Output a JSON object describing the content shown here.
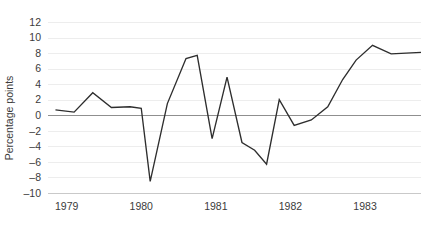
{
  "chart_data": {
    "type": "line",
    "title": "",
    "xlabel": "",
    "ylabel": "Percentage points",
    "ylim": [
      -10,
      12
    ],
    "xlim": [
      1978.75,
      1983.75
    ],
    "grid": true,
    "legend": "none",
    "zero_reference_line": 0,
    "y_ticks": [
      12,
      10,
      8,
      6,
      4,
      2,
      0,
      -2,
      -4,
      -6,
      -8,
      -10
    ],
    "y_tick_labels": [
      "12",
      "10",
      "8",
      "6",
      "4",
      "2",
      "0",
      "-2",
      "-4",
      "-6",
      "-8",
      "-10"
    ],
    "x_ticks": [
      1979,
      1980,
      1981,
      1982,
      1983
    ],
    "x_tick_labels": [
      "1979",
      "1980",
      "1981",
      "1982",
      "1983"
    ],
    "series": [
      {
        "name": "",
        "color": "#2e2e2e",
        "x": [
          1978.85,
          1979.1,
          1979.35,
          1979.6,
          1979.85,
          1980.0,
          1980.12,
          1980.35,
          1980.6,
          1980.75,
          1980.95,
          1981.15,
          1981.35,
          1981.52,
          1981.68,
          1981.85,
          1982.05,
          1982.28,
          1982.5,
          1982.7,
          1982.88,
          1983.1,
          1983.35,
          1983.55,
          1983.75
        ],
        "values": [
          0.7,
          0.4,
          2.9,
          1.0,
          1.1,
          0.9,
          -8.5,
          1.5,
          7.3,
          7.7,
          -3.0,
          4.9,
          -3.5,
          -4.5,
          -6.3,
          2.0,
          -1.3,
          -0.6,
          1.1,
          4.6,
          7.1,
          9.0,
          7.9,
          8.0,
          8.1
        ]
      }
    ]
  },
  "axis": {
    "y_axis_title": "Percentage points"
  }
}
